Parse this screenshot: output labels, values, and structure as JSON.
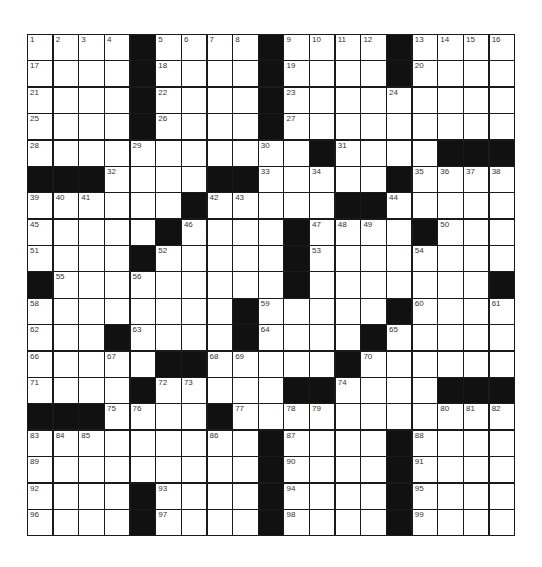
{
  "puzzle": {
    "rows": 19,
    "cols": 19,
    "colors": {
      "block": "#111111",
      "cell": "#ffffff",
      "line": "#1a1a1a",
      "number": "#333333"
    },
    "layout": [
      "....#....#....#....",
      "....#....#....#....",
      "....#....#.........",
      "....#....#.........",
      "...........#....###",
      "###....##.....#....",
      "......#.....##.....",
      ".....#....#....#...",
      "....#.....#........",
      "#.........#.......#",
      "........#.....#....",
      "...#....#....#.....",
      ".....##.....#......",
      "....#.....##....###",
      "###....#...........",
      ".........#....#....",
      ".........#....#....",
      "....#....#....#....",
      "....#....#....#...."
    ],
    "numbers": [
      {
        "r": 0,
        "c": 0,
        "n": 1
      },
      {
        "r": 0,
        "c": 1,
        "n": 2
      },
      {
        "r": 0,
        "c": 2,
        "n": 3
      },
      {
        "r": 0,
        "c": 3,
        "n": 4
      },
      {
        "r": 0,
        "c": 5,
        "n": 5
      },
      {
        "r": 0,
        "c": 6,
        "n": 6
      },
      {
        "r": 0,
        "c": 7,
        "n": 7
      },
      {
        "r": 0,
        "c": 8,
        "n": 8
      },
      {
        "r": 0,
        "c": 10,
        "n": 9
      },
      {
        "r": 0,
        "c": 11,
        "n": 10
      },
      {
        "r": 0,
        "c": 12,
        "n": 11
      },
      {
        "r": 0,
        "c": 13,
        "n": 12
      },
      {
        "r": 0,
        "c": 15,
        "n": 13
      },
      {
        "r": 0,
        "c": 16,
        "n": 14
      },
      {
        "r": 0,
        "c": 17,
        "n": 15
      },
      {
        "r": 0,
        "c": 18,
        "n": 16
      },
      {
        "r": 1,
        "c": 0,
        "n": 17
      },
      {
        "r": 1,
        "c": 5,
        "n": 18
      },
      {
        "r": 1,
        "c": 10,
        "n": 19
      },
      {
        "r": 1,
        "c": 15,
        "n": 20
      },
      {
        "r": 2,
        "c": 0,
        "n": 21
      },
      {
        "r": 2,
        "c": 5,
        "n": 22
      },
      {
        "r": 2,
        "c": 10,
        "n": 23
      },
      {
        "r": 2,
        "c": 14,
        "n": 24
      },
      {
        "r": 3,
        "c": 0,
        "n": 25
      },
      {
        "r": 3,
        "c": 5,
        "n": 26
      },
      {
        "r": 3,
        "c": 10,
        "n": 27
      },
      {
        "r": 4,
        "c": 0,
        "n": 28
      },
      {
        "r": 4,
        "c": 4,
        "n": 29
      },
      {
        "r": 4,
        "c": 9,
        "n": 30
      },
      {
        "r": 4,
        "c": 12,
        "n": 31
      },
      {
        "r": 5,
        "c": 3,
        "n": 32
      },
      {
        "r": 5,
        "c": 9,
        "n": 33
      },
      {
        "r": 5,
        "c": 11,
        "n": 34
      },
      {
        "r": 5,
        "c": 15,
        "n": 35
      },
      {
        "r": 5,
        "c": 16,
        "n": 36
      },
      {
        "r": 5,
        "c": 17,
        "n": 37
      },
      {
        "r": 5,
        "c": 18,
        "n": 38
      },
      {
        "r": 6,
        "c": 0,
        "n": 39
      },
      {
        "r": 6,
        "c": 1,
        "n": 40
      },
      {
        "r": 6,
        "c": 2,
        "n": 41
      },
      {
        "r": 6,
        "c": 7,
        "n": 42
      },
      {
        "r": 6,
        "c": 8,
        "n": 43
      },
      {
        "r": 6,
        "c": 14,
        "n": 44
      },
      {
        "r": 7,
        "c": 0,
        "n": 45
      },
      {
        "r": 7,
        "c": 6,
        "n": 46
      },
      {
        "r": 7,
        "c": 11,
        "n": 47
      },
      {
        "r": 7,
        "c": 12,
        "n": 48
      },
      {
        "r": 7,
        "c": 13,
        "n": 49
      },
      {
        "r": 7,
        "c": 16,
        "n": 50
      },
      {
        "r": 8,
        "c": 0,
        "n": 51
      },
      {
        "r": 8,
        "c": 5,
        "n": 52
      },
      {
        "r": 8,
        "c": 11,
        "n": 53
      },
      {
        "r": 8,
        "c": 15,
        "n": 54
      },
      {
        "r": 9,
        "c": 1,
        "n": 55
      },
      {
        "r": 9,
        "c": 4,
        "n": 56
      },
      {
        "r": 9,
        "c": 10,
        "n": 57
      },
      {
        "r": 10,
        "c": 0,
        "n": 58
      },
      {
        "r": 10,
        "c": 9,
        "n": 59
      },
      {
        "r": 10,
        "c": 15,
        "n": 60
      },
      {
        "r": 10,
        "c": 18,
        "n": 61
      },
      {
        "r": 11,
        "c": 0,
        "n": 62
      },
      {
        "r": 11,
        "c": 4,
        "n": 63
      },
      {
        "r": 11,
        "c": 9,
        "n": 64
      },
      {
        "r": 11,
        "c": 14,
        "n": 65
      },
      {
        "r": 12,
        "c": 0,
        "n": 66
      },
      {
        "r": 12,
        "c": 3,
        "n": 67
      },
      {
        "r": 12,
        "c": 7,
        "n": 68
      },
      {
        "r": 12,
        "c": 8,
        "n": 69
      },
      {
        "r": 12,
        "c": 13,
        "n": 70
      },
      {
        "r": 13,
        "c": 0,
        "n": 71
      },
      {
        "r": 13,
        "c": 5,
        "n": 72
      },
      {
        "r": 13,
        "c": 6,
        "n": 73
      },
      {
        "r": 13,
        "c": 12,
        "n": 74
      },
      {
        "r": 14,
        "c": 3,
        "n": 75
      },
      {
        "r": 14,
        "c": 4,
        "n": 76
      },
      {
        "r": 14,
        "c": 8,
        "n": 77
      },
      {
        "r": 14,
        "c": 10,
        "n": 78
      },
      {
        "r": 14,
        "c": 11,
        "n": 79
      },
      {
        "r": 14,
        "c": 16,
        "n": 80
      },
      {
        "r": 14,
        "c": 17,
        "n": 81
      },
      {
        "r": 14,
        "c": 18,
        "n": 82
      },
      {
        "r": 15,
        "c": 0,
        "n": 83
      },
      {
        "r": 15,
        "c": 1,
        "n": 84
      },
      {
        "r": 15,
        "c": 2,
        "n": 85
      },
      {
        "r": 15,
        "c": 7,
        "n": 86
      },
      {
        "r": 15,
        "c": 10,
        "n": 87
      },
      {
        "r": 15,
        "c": 15,
        "n": 88
      },
      {
        "r": 16,
        "c": 0,
        "n": 89
      },
      {
        "r": 16,
        "c": 10,
        "n": 90
      },
      {
        "r": 16,
        "c": 15,
        "n": 91
      },
      {
        "r": 17,
        "c": 0,
        "n": 92
      },
      {
        "r": 17,
        "c": 5,
        "n": 93
      },
      {
        "r": 17,
        "c": 10,
        "n": 94
      },
      {
        "r": 17,
        "c": 15,
        "n": 95
      },
      {
        "r": 18,
        "c": 0,
        "n": 96
      },
      {
        "r": 18,
        "c": 5,
        "n": 97
      },
      {
        "r": 18,
        "c": 10,
        "n": 98
      },
      {
        "r": 18,
        "c": 15,
        "n": 99
      }
    ]
  }
}
